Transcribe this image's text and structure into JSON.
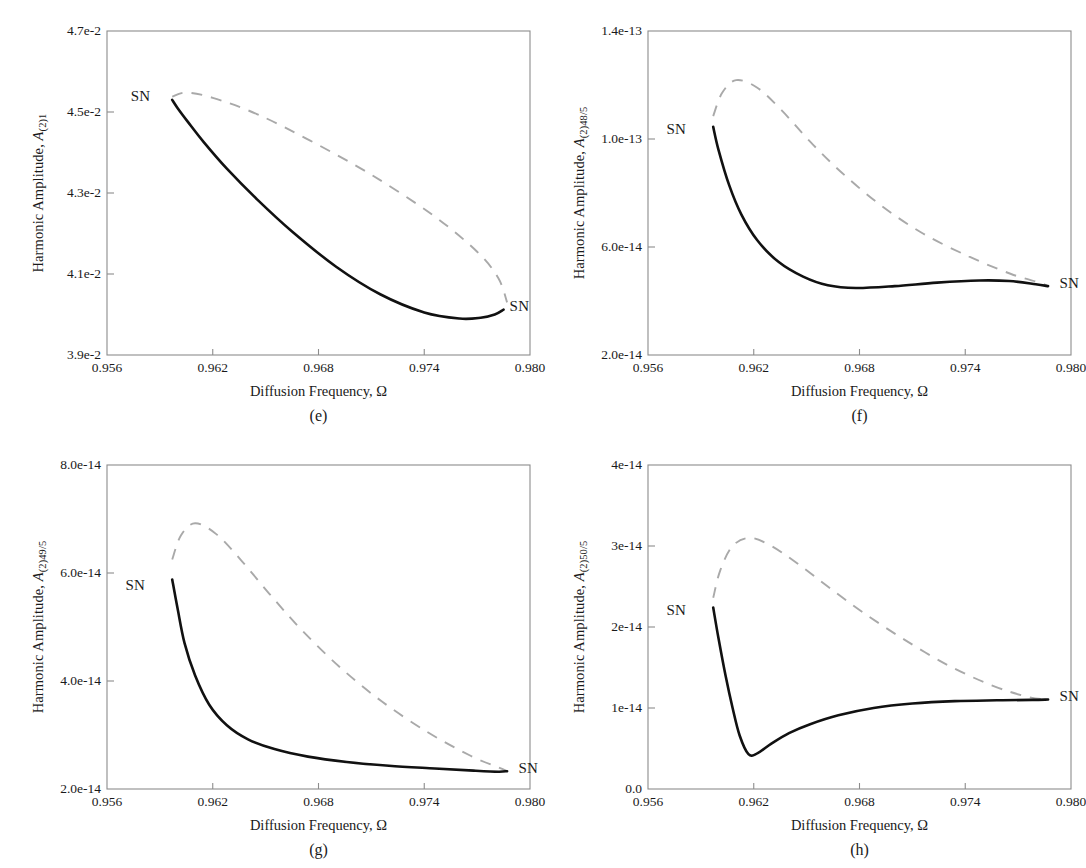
{
  "figure": {
    "type": "multi-panel-frequency-response",
    "panels_count": 4
  },
  "common": {
    "xlabel": "Diffusion Frequency, Ω",
    "ylabel_prefix": "Harmonic Amplitude, ",
    "ylabel_symbol": "A",
    "sn_label": "SN",
    "xticks": [
      "0.956",
      "0.962",
      "0.968",
      "0.974",
      "0.980"
    ],
    "xtick_values": [
      0.956,
      0.962,
      0.968,
      0.974,
      0.98
    ],
    "xlim": [
      0.956,
      0.98
    ],
    "colors": {
      "stable_branch": "#111111",
      "unstable_branch": "#a9a9a9",
      "frame": "#8c8c8c",
      "text": "#1a1a1a",
      "background": "#ffffff"
    },
    "legend_semantics": {
      "solid": "stable branch",
      "dashed": "unstable branch",
      "SN": "saddle-node bifurcation point"
    }
  },
  "chart_data": [
    {
      "id": "e",
      "caption": "(e)",
      "type": "line",
      "title": "",
      "xlabel": "Diffusion Frequency, Ω",
      "ylabel": "Harmonic Amplitude, A(2)1",
      "ylabel_sub": "(2)1",
      "xlim": [
        0.956,
        0.98
      ],
      "ylim": [
        0.039,
        0.047
      ],
      "xticks": [
        0.956,
        0.962,
        0.968,
        0.974,
        0.98
      ],
      "yticks": [
        0.039,
        0.041,
        0.043,
        0.045,
        0.047
      ],
      "ytick_labels": [
        "3.9e-2",
        "4.1e-2",
        "4.3e-2",
        "4.5e-2",
        "4.7e-2"
      ],
      "grid": false,
      "legend": "none",
      "annotations": [
        {
          "text": "SN",
          "x": 0.9595,
          "y": 0.04535,
          "placement": "left"
        },
        {
          "text": "SN",
          "x": 0.9785,
          "y": 0.04015,
          "placement": "right"
        }
      ],
      "series": [
        {
          "name": "stable",
          "style": "solid",
          "x": [
            0.9597,
            0.96,
            0.9606,
            0.9615,
            0.9628,
            0.9645,
            0.9665,
            0.969,
            0.9715,
            0.974,
            0.976,
            0.9772,
            0.978,
            0.9785
          ],
          "y": [
            0.0453,
            0.0451,
            0.04475,
            0.04425,
            0.0436,
            0.04285,
            0.04205,
            0.04118,
            0.0405,
            0.04005,
            0.0399,
            0.03992,
            0.04,
            0.04012
          ]
        },
        {
          "name": "unstable",
          "style": "dashed",
          "x": [
            0.9597,
            0.9605,
            0.962,
            0.9645,
            0.9675,
            0.971,
            0.9745,
            0.977,
            0.9782,
            0.9787
          ],
          "y": [
            0.04538,
            0.04548,
            0.04535,
            0.04495,
            0.0443,
            0.04345,
            0.04245,
            0.04155,
            0.0409,
            0.0403
          ]
        }
      ]
    },
    {
      "id": "f",
      "caption": "(f)",
      "type": "line",
      "title": "",
      "xlabel": "Diffusion Frequency, Ω",
      "ylabel": "Harmonic Amplitude, A(2)48/5",
      "ylabel_sub": "(2)48/5",
      "xlim": [
        0.956,
        0.98
      ],
      "ylim": [
        2e-14,
        1.4e-13
      ],
      "xticks": [
        0.956,
        0.962,
        0.968,
        0.974,
        0.98
      ],
      "yticks": [
        2e-14,
        6e-14,
        1e-13,
        1.4e-13
      ],
      "ytick_labels": [
        "2.0e-14",
        "6.0e-14",
        "1.0e-13",
        "1.4e-13"
      ],
      "grid": false,
      "legend": "none",
      "annotations": [
        {
          "text": "SN",
          "x": 0.9592,
          "y": 1.03e-13,
          "placement": "left"
        },
        {
          "text": "SN",
          "x": 0.979,
          "y": 4.6e-14,
          "placement": "right"
        }
      ],
      "series": [
        {
          "name": "stable",
          "style": "solid",
          "x": [
            0.9597,
            0.96,
            0.9606,
            0.9613,
            0.9622,
            0.9634,
            0.9648,
            0.9662,
            0.9678,
            0.97,
            0.9724,
            0.9748,
            0.9765,
            0.978,
            0.9787
          ],
          "y": [
            1.045e-13,
            9.6e-14,
            8.3e-14,
            7.2e-14,
            6.25e-14,
            5.45e-14,
            4.9e-14,
            4.58e-14,
            4.48e-14,
            4.55e-14,
            4.68e-14,
            4.76e-14,
            4.74e-14,
            4.62e-14,
            4.55e-14
          ]
        },
        {
          "name": "unstable",
          "style": "dashed",
          "x": [
            0.9597,
            0.9602,
            0.961,
            0.9622,
            0.9636,
            0.9652,
            0.967,
            0.9692,
            0.9716,
            0.9742,
            0.9766,
            0.9782,
            0.9787
          ],
          "y": [
            1.085e-13,
            1.17e-13,
            1.218e-13,
            1.19e-13,
            1.105e-13,
            9.9e-14,
            8.75e-14,
            7.55e-14,
            6.5e-14,
            5.65e-14,
            5e-14,
            4.68e-14,
            4.55e-14
          ]
        }
      ]
    },
    {
      "id": "g",
      "caption": "(g)",
      "type": "line",
      "title": "",
      "xlabel": "Diffusion Frequency, Ω",
      "ylabel": "Harmonic Amplitude, A(2)49/5",
      "ylabel_sub": "(2)49/5",
      "xlim": [
        0.956,
        0.98
      ],
      "ylim": [
        2e-14,
        8e-14
      ],
      "xticks": [
        0.956,
        0.962,
        0.968,
        0.974,
        0.98
      ],
      "yticks": [
        2e-14,
        4e-14,
        6e-14,
        8e-14
      ],
      "ytick_labels": [
        "2.0e-14",
        "4.0e-14",
        "6.0e-14",
        "8.0e-14"
      ],
      "grid": false,
      "legend": "none",
      "annotations": [
        {
          "text": "SN",
          "x": 0.9592,
          "y": 5.75e-14,
          "placement": "left"
        },
        {
          "text": "SN",
          "x": 0.979,
          "y": 2.35e-14,
          "placement": "right"
        }
      ],
      "series": [
        {
          "name": "stable",
          "style": "solid",
          "x": [
            0.9597,
            0.96,
            0.9604,
            0.961,
            0.9618,
            0.9628,
            0.964,
            0.9655,
            0.9674,
            0.9696,
            0.972,
            0.9746,
            0.9768,
            0.9782,
            0.9787
          ],
          "y": [
            5.88e-14,
            5.35e-14,
            4.7e-14,
            4.1e-14,
            3.56e-14,
            3.18e-14,
            2.92e-14,
            2.74e-14,
            2.6e-14,
            2.5e-14,
            2.43e-14,
            2.38e-14,
            2.34e-14,
            2.32e-14,
            2.33e-14
          ]
        },
        {
          "name": "unstable",
          "style": "dashed",
          "x": [
            0.9597,
            0.9602,
            0.961,
            0.9622,
            0.9636,
            0.9652,
            0.967,
            0.9692,
            0.9716,
            0.9742,
            0.9766,
            0.9782,
            0.9787
          ],
          "y": [
            6.25e-14,
            6.7e-14,
            6.92e-14,
            6.72e-14,
            6.24e-14,
            5.62e-14,
            4.96e-14,
            4.26e-14,
            3.62e-14,
            3.05e-14,
            2.62e-14,
            2.4e-14,
            2.33e-14
          ]
        }
      ]
    },
    {
      "id": "h",
      "caption": "(h)",
      "type": "line",
      "title": "",
      "xlabel": "Diffusion Frequency, Ω",
      "ylabel": "Harmonic Amplitude, A(2)50/5",
      "ylabel_sub": "(2)50/5",
      "xlim": [
        0.956,
        0.98
      ],
      "ylim": [
        0.0,
        4e-14
      ],
      "xticks": [
        0.956,
        0.962,
        0.968,
        0.974,
        0.98
      ],
      "yticks": [
        0.0,
        1e-14,
        2e-14,
        3e-14,
        4e-14
      ],
      "ytick_labels": [
        "0.0",
        "1e-14",
        "2e-14",
        "3e-14",
        "4e-14"
      ],
      "grid": false,
      "legend": "none",
      "annotations": [
        {
          "text": "SN",
          "x": 0.9592,
          "y": 2.18e-14,
          "placement": "left"
        },
        {
          "text": "SN",
          "x": 0.979,
          "y": 1.12e-14,
          "placement": "right"
        }
      ],
      "series": [
        {
          "name": "stable",
          "style": "solid",
          "x": [
            0.9597,
            0.96,
            0.9604,
            0.9608,
            0.9612,
            0.9617,
            0.9622,
            0.963,
            0.964,
            0.9652,
            0.9668,
            0.9688,
            0.971,
            0.9734,
            0.9758,
            0.9778,
            0.9787
          ],
          "y": [
            2.24e-14,
            1.86e-14,
            1.4e-14,
            1e-14,
            6.6e-15,
            4.3e-15,
            4.4e-15,
            5.6e-15,
            6.9e-15,
            8e-15,
            9.1e-15,
            1e-14,
            1.055e-14,
            1.085e-14,
            1.095e-14,
            1.1e-14,
            1.105e-14
          ]
        },
        {
          "name": "unstable",
          "style": "dashed",
          "x": [
            0.9597,
            0.9601,
            0.9608,
            0.9618,
            0.963,
            0.9645,
            0.9662,
            0.9682,
            0.9705,
            0.973,
            0.9755,
            0.9775,
            0.9787
          ],
          "y": [
            2.36e-14,
            2.7e-14,
            3e-14,
            3.1e-14,
            3e-14,
            2.78e-14,
            2.5e-14,
            2.18e-14,
            1.85e-14,
            1.53e-14,
            1.28e-14,
            1.14e-14,
            1.105e-14
          ]
        }
      ]
    }
  ]
}
